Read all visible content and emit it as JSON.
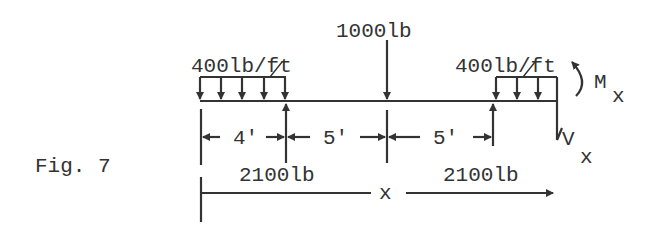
{
  "figure": {
    "caption": "Fig. 7",
    "point_load": "1000lb",
    "dist_load_left": "400lb/ft",
    "dist_load_right": "400lb/ft",
    "reaction_left": "2100lb",
    "reaction_right": "2100lb",
    "moment_label": "M",
    "moment_sub": "x",
    "shear_label": "V",
    "shear_sub": "x",
    "dim_1": "4'",
    "dim_2": "5'",
    "dim_3": "5'",
    "position_var": "x"
  },
  "colors": {
    "ink": "#333333",
    "background": "#ffffff"
  }
}
